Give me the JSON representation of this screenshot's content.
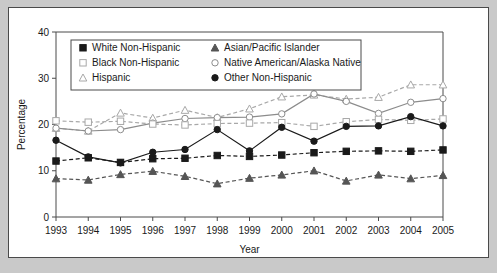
{
  "figure": {
    "background_color": "#c9c9c9",
    "panel_color": "#ffffff",
    "border_color": "#4a4a4a"
  },
  "chart_data": {
    "type": "line",
    "title": "",
    "xlabel": "Year",
    "ylabel": "Percentage",
    "categories": [
      "1993",
      "1994",
      "1995",
      "1996",
      "1997",
      "1998",
      "1999",
      "2000",
      "2001",
      "2002",
      "2003",
      "2004",
      "2005"
    ],
    "x": [
      1993,
      1994,
      1995,
      1996,
      1997,
      1998,
      1999,
      2000,
      2001,
      2002,
      2003,
      2004,
      2005
    ],
    "xlim": [
      1993,
      2005
    ],
    "ylim": [
      0,
      40
    ],
    "yticks": [
      0,
      10,
      20,
      30,
      40
    ],
    "grid": false,
    "legend_position": "upper-left-inside",
    "series": [
      {
        "name": "White Non-Hispanic",
        "marker": "filled-square",
        "color": "#1a1a1a",
        "line_style": "dashed",
        "values": [
          12.1,
          12.8,
          11.8,
          12.6,
          12.7,
          13.3,
          13.1,
          13.4,
          13.9,
          14.2,
          14.3,
          14.2,
          14.5
        ]
      },
      {
        "name": "Black Non-Hispanic",
        "marker": "open-square",
        "color": "#a8a8a8",
        "line_style": "dashed",
        "values": [
          20.8,
          20.5,
          20.7,
          20.1,
          19.9,
          20.2,
          20.3,
          20.4,
          19.6,
          20.6,
          21.1,
          20.9,
          21.2
        ]
      },
      {
        "name": "Hispanic",
        "marker": "open-triangle",
        "color": "#a8a8a8",
        "line_style": "dashed",
        "values": [
          19.2,
          18.6,
          22.5,
          21.4,
          23.1,
          21.5,
          23.4,
          26.0,
          26.4,
          25.5,
          25.9,
          28.6,
          28.6
        ]
      },
      {
        "name": "Asian/Pacific Islander",
        "marker": "filled-triangle",
        "color": "#555555",
        "line_style": "dashed",
        "values": [
          8.3,
          8.0,
          9.2,
          9.9,
          8.8,
          7.2,
          8.4,
          9.1,
          10.0,
          7.8,
          9.1,
          8.3,
          9.0
        ]
      },
      {
        "name": "Native American/Alaska Native",
        "marker": "open-circle",
        "color": "#8c8c8c",
        "line_style": "solid",
        "values": [
          19.2,
          18.6,
          18.9,
          20.3,
          21.3,
          21.5,
          21.6,
          22.3,
          26.6,
          25.0,
          22.4,
          24.8,
          25.6
        ]
      },
      {
        "name": "Other Non-Hispanic",
        "marker": "filled-circle",
        "color": "#1a1a1a",
        "line_style": "solid",
        "values": [
          16.6,
          13.0,
          11.7,
          14.0,
          14.6,
          18.9,
          14.3,
          19.4,
          16.4,
          19.6,
          19.7,
          21.7,
          19.7
        ]
      }
    ]
  }
}
